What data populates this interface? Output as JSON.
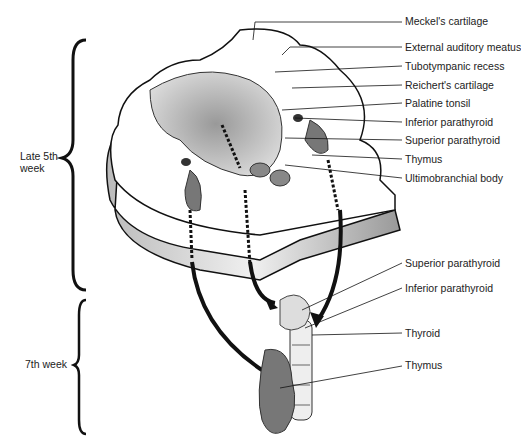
{
  "diagram": {
    "type": "anatomical-illustration",
    "stages": [
      {
        "label": "Late 5th\nweek",
        "line1": "Late 5th",
        "line2": "week"
      },
      {
        "label": "7th week"
      }
    ],
    "labels_upper": [
      "Meckel's cartilage",
      "External auditory meatus",
      "Tubotympanic recess",
      "Reichert's cartilage",
      "Palatine tonsil",
      "Inferior parathyroid",
      "Superior parathyroid",
      "Thymus",
      "Ultimobranchial body"
    ],
    "labels_lower": [
      "Superior parathyroid",
      "Inferior parathyroid",
      "Thyroid",
      "Thymus"
    ]
  }
}
